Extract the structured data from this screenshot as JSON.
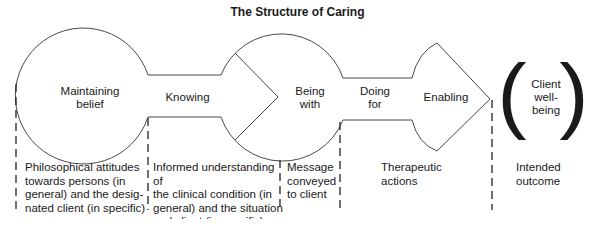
{
  "title": "The Structure of Caring",
  "nodes": {
    "maintaining_belief": "Maintaining\nbelief",
    "knowing": "Knowing",
    "being_with": "Being\nwith",
    "doing_for": "Doing\nfor",
    "enabling": "Enabling",
    "client_wellbeing": "Client\nwell-\nbeing"
  },
  "descriptions": [
    "Philosophical attitudes\ntowards persons (in\ngeneral) and the desig-\nnated client (in specific)",
    "Informed understanding of\nthe clinical condition (in\ngeneral) and the situation\nand client (in specific)",
    "Message\nconveyed\nto client",
    "Therapeutic\nactions",
    "Intended\noutcome"
  ],
  "brackets": {
    "open": "(",
    "close": ")"
  },
  "colors": {
    "stroke": "#333333",
    "text": "#1a1a1a",
    "background": "#ffffff"
  }
}
